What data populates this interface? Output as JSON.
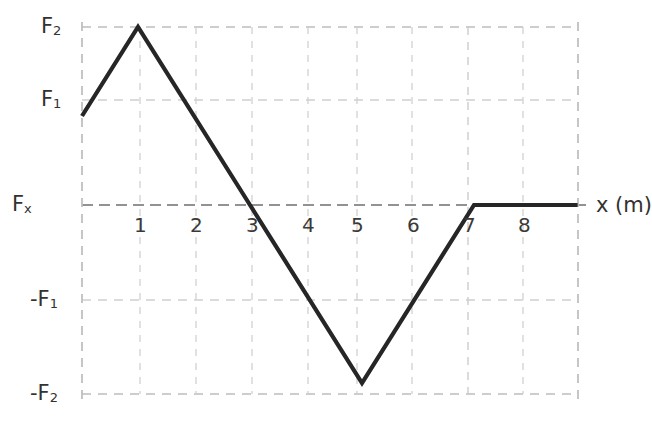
{
  "chart_data": {
    "type": "line",
    "title": "",
    "subtitle": "",
    "xlabel": "x (m)",
    "ylabel": "F_x",
    "ylabel_display": "Fx",
    "xlim": [
      0,
      8.85
    ],
    "ylim": [
      -1,
      1
    ],
    "grid": true,
    "legend": null,
    "x_tick_labels": [
      "1",
      "2",
      "3",
      "4",
      "5",
      "6",
      "7",
      "8"
    ],
    "x_tick_values": [
      1,
      2,
      3,
      4,
      5,
      6,
      7,
      8
    ],
    "y_tick_labels": [
      "F2",
      "F1",
      "Fx",
      "-F1",
      "-F2"
    ],
    "y_tick_display": [
      {
        "base": "F",
        "sub": "2",
        "sign": ""
      },
      {
        "base": "F",
        "sub": "1",
        "sign": ""
      },
      {
        "base": "F",
        "sub": "x",
        "sign": ""
      },
      {
        "base": "F",
        "sub": "1",
        "sign": "-"
      },
      {
        "base": "F",
        "sub": "2",
        "sign": "-"
      }
    ],
    "y_tick_values": [
      1,
      0.5,
      0,
      -0.5,
      -1
    ],
    "series": [
      {
        "name": "Fx(x)",
        "color": "#262626",
        "points": [
          {
            "x": 0,
            "y": 0.5,
            "label": "F1"
          },
          {
            "x": 1,
            "y": 1,
            "label": "F2"
          },
          {
            "x": 3,
            "y": 0,
            "label": "0"
          },
          {
            "x": 5,
            "y": -1,
            "label": "-F2"
          },
          {
            "x": 7,
            "y": 0,
            "label": "0"
          },
          {
            "x": 8.85,
            "y": 0,
            "label": "0"
          }
        ]
      }
    ],
    "annotations": [],
    "grid_color": "#c6c6c6",
    "axis_color": "#8f8f8f",
    "curve_color": "#262626",
    "background": "#ffffff"
  },
  "axes": {
    "x_axis_label": "x (m)",
    "y_axis_label_base": "F",
    "y_axis_label_sub": "x"
  },
  "ticks": {
    "x": [
      {
        "label": "1"
      },
      {
        "label": "2"
      },
      {
        "label": "3"
      },
      {
        "label": "4"
      },
      {
        "label": "5"
      },
      {
        "label": "6"
      },
      {
        "label": "7"
      },
      {
        "label": "8"
      }
    ],
    "y": [
      {
        "sign": "",
        "base": "F",
        "sub": "2"
      },
      {
        "sign": "",
        "base": "F",
        "sub": "1"
      },
      {
        "sign": "",
        "base": "F",
        "sub": "x"
      },
      {
        "sign": "-",
        "base": "F",
        "sub": "1"
      },
      {
        "sign": "-",
        "base": "F",
        "sub": "2"
      }
    ]
  }
}
